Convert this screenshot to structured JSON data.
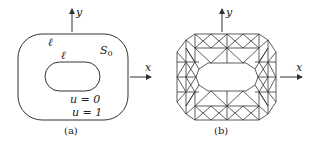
{
  "figure_a": {
    "caption": "(a)",
    "x_axis_label": "x",
    "y_axis_label": "y",
    "outer_boundary_label": "ℓ",
    "inner_boundary_label": "ℓ",
    "region_label": "S",
    "region_subscript": "0",
    "inner_condition": "u = 0",
    "outer_condition": "u = 1"
  },
  "figure_b": {
    "caption": "(b)",
    "x_axis_label": "x",
    "y_axis_label": "y",
    "description": "triangular finite element mesh"
  },
  "colors": {
    "line": "#333333",
    "background": "#ffffff"
  }
}
